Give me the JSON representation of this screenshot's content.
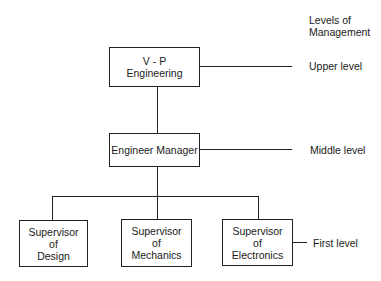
{
  "levels_header": {
    "line1": "Levels of",
    "line2": "Management"
  },
  "nodes": {
    "vp": {
      "line1": "V - P",
      "line2": "Engineering"
    },
    "manager": {
      "line1": "Engineer Manager"
    },
    "design": {
      "line1": "Supervisor",
      "line2": "of",
      "line3": "Design"
    },
    "mechanics": {
      "line1": "Supervisor",
      "line2": "of",
      "line3": "Mechanics"
    },
    "electronics": {
      "line1": "Supervisor",
      "line2": "of",
      "line3": "Electronics"
    }
  },
  "levels": {
    "upper": "Upper level",
    "middle": "Middle level",
    "first": "First level"
  },
  "colors": {
    "line": "#222222",
    "text": "#1a1a1a",
    "background": "#ffffff"
  }
}
